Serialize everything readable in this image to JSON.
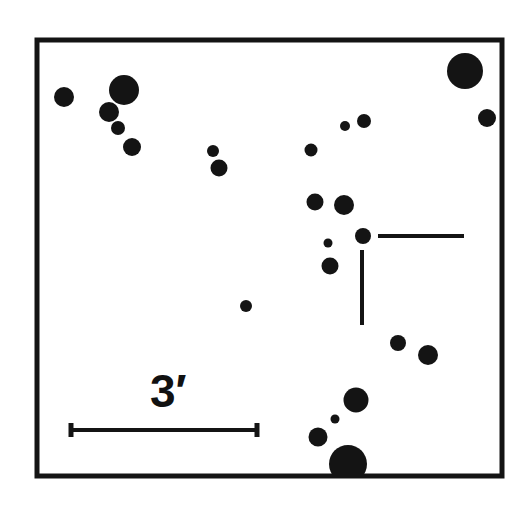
{
  "finder_chart": {
    "frame": {
      "x": 37,
      "y": 40,
      "width": 465,
      "height": 436,
      "stroke": "#141414",
      "stroke_width": 5
    },
    "ink_color": "#141414",
    "stars": [
      {
        "cx": 64,
        "cy": 97,
        "r": 10
      },
      {
        "cx": 124,
        "cy": 90,
        "r": 15
      },
      {
        "cx": 109,
        "cy": 112,
        "r": 10
      },
      {
        "cx": 118,
        "cy": 128,
        "r": 7
      },
      {
        "cx": 132,
        "cy": 147,
        "r": 9
      },
      {
        "cx": 213,
        "cy": 151,
        "r": 6
      },
      {
        "cx": 219,
        "cy": 168,
        "r": 8.5
      },
      {
        "cx": 465,
        "cy": 71,
        "r": 18
      },
      {
        "cx": 487,
        "cy": 118,
        "r": 9
      },
      {
        "cx": 345,
        "cy": 126,
        "r": 5
      },
      {
        "cx": 364,
        "cy": 121,
        "r": 7
      },
      {
        "cx": 311,
        "cy": 150,
        "r": 6.5
      },
      {
        "cx": 315,
        "cy": 202,
        "r": 8.5
      },
      {
        "cx": 344,
        "cy": 205,
        "r": 10
      },
      {
        "cx": 363,
        "cy": 236,
        "r": 8
      },
      {
        "cx": 328,
        "cy": 243,
        "r": 4.5
      },
      {
        "cx": 330,
        "cy": 266,
        "r": 8.5
      },
      {
        "cx": 246,
        "cy": 306,
        "r": 6
      },
      {
        "cx": 398,
        "cy": 343,
        "r": 8
      },
      {
        "cx": 428,
        "cy": 355,
        "r": 10
      },
      {
        "cx": 356,
        "cy": 400,
        "r": 12.5
      },
      {
        "cx": 335,
        "cy": 419,
        "r": 4.5
      },
      {
        "cx": 318,
        "cy": 437,
        "r": 9.5
      },
      {
        "cx": 348,
        "cy": 464,
        "r": 19
      }
    ],
    "target_marker": {
      "horizontal": {
        "x1": 378,
        "y1": 236,
        "x2": 464,
        "y2": 236
      },
      "vertical": {
        "x1": 362,
        "y1": 250,
        "x2": 362,
        "y2": 325
      },
      "stroke_width": 4
    },
    "scale_bar": {
      "x1": 71,
      "x2": 257,
      "y": 430,
      "tick_height": 14,
      "stroke_width": 4,
      "label": "3′"
    }
  }
}
